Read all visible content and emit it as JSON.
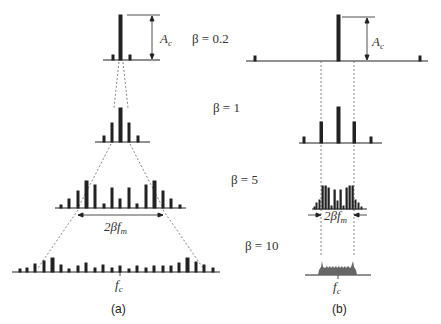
{
  "figure": {
    "panels": [
      {
        "id": "a",
        "caption": "(a)",
        "description": "Fixed modulating frequency; bandwidth grows with beta"
      },
      {
        "id": "b",
        "caption": "(b)",
        "description": "Fixed frequency deviation; bandwidth approx constant 2*beta*f_m"
      }
    ],
    "labels": {
      "carrier_amplitude": "A",
      "carrier_amplitude_sub": "c",
      "beta_02": "β = 0.2",
      "beta_1": "β = 1",
      "beta_5": "β = 5",
      "beta_10": "β = 10",
      "bandwidth_a_pre": "2βf",
      "bandwidth_a_sub": "m",
      "bandwidth_b_pre": "2βf",
      "bandwidth_b_sub": "m",
      "center_freq_a": "f",
      "center_freq_a_sub": "c",
      "center_freq_b": "f",
      "center_freq_b_sub": "c",
      "caption_a": "(a)",
      "caption_b": "(b)"
    },
    "colors": {
      "line": "#222222",
      "dash": "#666666",
      "fill_b10": "#666666"
    }
  }
}
